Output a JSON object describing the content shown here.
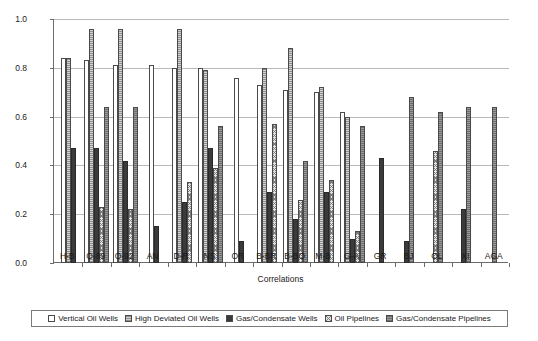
{
  "chart_data": {
    "type": "bar",
    "title": "",
    "xlabel": "Correlations",
    "ylabel": "Score",
    "ylim": [
      0.0,
      1.0
    ],
    "ytick_labels": [
      "0.0",
      "0.2",
      "0.4",
      "0.6",
      "0.8",
      "1.0"
    ],
    "ytick_values": [
      0.0,
      0.2,
      0.4,
      0.6,
      0.8,
      1.0
    ],
    "grid": true,
    "legend_position": "bottom",
    "categories": [
      "H-B",
      "O-89",
      "O-92",
      "AN",
      "D-R",
      "NS",
      "OR",
      "B-BR",
      "B-BO",
      "M-B",
      "G-A",
      "GR",
      "BJ",
      "OL",
      "XI",
      "AGA"
    ],
    "series": [
      {
        "name": "Vertical Oil Wells",
        "pattern": "white",
        "color": "#ffffff",
        "values": [
          0.84,
          0.83,
          0.81,
          0.81,
          0.8,
          0.8,
          0.76,
          0.73,
          0.71,
          0.7,
          0.62,
          null,
          null,
          null,
          null,
          null
        ]
      },
      {
        "name": "High Deviated Oil Wells",
        "pattern": "light-vertical-hatch",
        "color": "#d3d3d3",
        "values": [
          0.84,
          0.96,
          0.96,
          null,
          0.96,
          0.79,
          null,
          0.8,
          0.88,
          0.72,
          0.6,
          null,
          null,
          null,
          null,
          null
        ]
      },
      {
        "name": "Gas/Condensate Wells",
        "pattern": "solid-dark",
        "color": "#3b3b3b",
        "values": [
          0.47,
          0.47,
          0.42,
          0.15,
          0.25,
          0.47,
          0.09,
          0.29,
          0.18,
          0.29,
          0.1,
          0.43,
          0.09,
          null,
          0.22,
          null
        ]
      },
      {
        "name": "Oil Pipelines",
        "pattern": "cross-hatch",
        "color": "#e4e4e4",
        "values": [
          null,
          0.23,
          0.22,
          null,
          0.33,
          0.39,
          null,
          0.57,
          0.26,
          0.34,
          0.13,
          null,
          null,
          0.46,
          null,
          null
        ]
      },
      {
        "name": "Gas/Condensate Pipelines",
        "pattern": "gray-vertical-hatch",
        "color": "#9a9a9a",
        "values": [
          null,
          0.64,
          0.64,
          null,
          null,
          0.56,
          null,
          null,
          0.42,
          null,
          0.56,
          null,
          0.68,
          0.62,
          0.64,
          0.64
        ]
      }
    ]
  },
  "axes": {
    "y_label": "Score",
    "x_label": "Correlations"
  },
  "legend": {
    "items": [
      {
        "label": "Vertical Oil Wells"
      },
      {
        "label": "High Deviated Oil Wells"
      },
      {
        "label": "Gas/Condensate Wells"
      },
      {
        "label": "Oil Pipelines"
      },
      {
        "label": "Gas/Condensate Pipelines"
      }
    ]
  }
}
